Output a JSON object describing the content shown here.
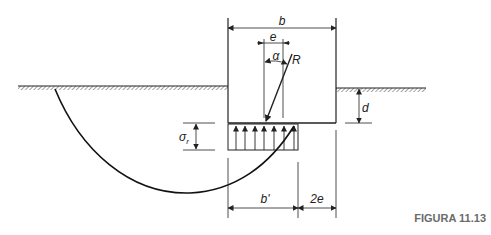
{
  "figure": {
    "caption": "FIGURA 11.13",
    "labels": {
      "b": "b",
      "e": "e",
      "alpha": "α",
      "R": "R",
      "d": "d",
      "sigma_r": "σ",
      "sigma_r_sub": "r",
      "b_prime": "b'",
      "two_e": "2e"
    },
    "colors": {
      "line": "#222222",
      "caption": "#6b6b6b",
      "background": "#ffffff"
    }
  }
}
